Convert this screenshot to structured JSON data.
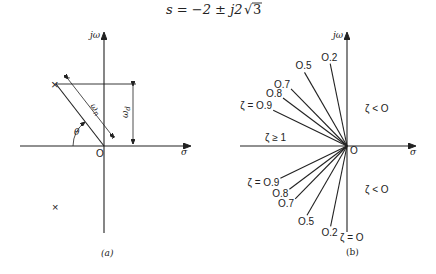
{
  "title": {
    "equation_prefix": "s = −2 ± j2",
    "sqrt_symbol": "√",
    "sqrt_arg": "3"
  },
  "figure_a": {
    "caption": "(a)",
    "y_axis_label": "jω",
    "x_axis_label": "σ",
    "origin_label": "O",
    "pole_marker": "×",
    "wn_label_main": "ω",
    "wn_label_sub": "n",
    "wd_label_main": "ω",
    "wd_label_sub": "d",
    "theta_label": "θ"
  },
  "figure_b": {
    "caption": "(b)",
    "y_axis_label": "jω",
    "x_axis_label": "σ",
    "origin_label": "O",
    "region_left_label": "ζ ≥ 1",
    "region_right_upper_label": "ζ < O",
    "region_right_lower_label": "ζ < O",
    "zeta_zero_label": "ζ = O",
    "upper_rays": [
      {
        "zeta": 0.2,
        "label": "O.2"
      },
      {
        "zeta": 0.5,
        "label": "O.5"
      },
      {
        "zeta": 0.7,
        "label": "O.7"
      },
      {
        "zeta": 0.8,
        "label": "O.8"
      },
      {
        "zeta": 0.9,
        "label": "ζ = O.9"
      }
    ],
    "lower_rays": [
      {
        "zeta": 0.9,
        "label": "ζ = O.9"
      },
      {
        "zeta": 0.8,
        "label": "O.8"
      },
      {
        "zeta": 0.7,
        "label": "O.7"
      },
      {
        "zeta": 0.5,
        "label": "O.5"
      },
      {
        "zeta": 0.2,
        "label": "O.2"
      }
    ]
  }
}
